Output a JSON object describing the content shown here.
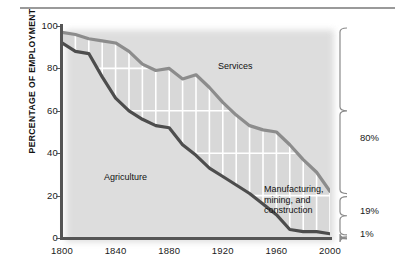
{
  "figure": {
    "top_rule": true
  },
  "axes": {
    "y_axis_title": "PERCENTAGE OF EMPLOYMENT",
    "y_ticks": [
      {
        "value": 100,
        "label": "100"
      },
      {
        "value": 80,
        "label": "80"
      },
      {
        "value": 60,
        "label": "60"
      },
      {
        "value": 40,
        "label": "40"
      },
      {
        "value": 20,
        "label": "20"
      },
      {
        "value": 0,
        "label": "0"
      }
    ],
    "x_ticks": [
      {
        "value": 1800,
        "label": "1800"
      },
      {
        "value": 1840,
        "label": "1840"
      },
      {
        "value": 1880,
        "label": "1880"
      },
      {
        "value": 1920,
        "label": "1920"
      },
      {
        "value": 1960,
        "label": "1960"
      },
      {
        "value": 2000,
        "label": "2000"
      }
    ]
  },
  "labels": {
    "services": "Services",
    "agriculture": "Agriculture",
    "manufacturing_line1": "Manufacturing,",
    "manufacturing_line2": "mining, and",
    "manufacturing_line3": "construction"
  },
  "annotations": {
    "brace_services": "80%",
    "brace_manufacturing": "19%",
    "brace_agriculture": "1%"
  },
  "colors": {
    "agriculture_line": "#4d4d4d",
    "services_line": "#8c8c8c",
    "band_fill": "#d8d8d8",
    "gridline": "#ffffff",
    "axis": "#555555",
    "text": "#1a1a1a"
  },
  "chart_data": {
    "type": "area",
    "title": "",
    "subtitle": "",
    "xlabel": "",
    "ylabel": "PERCENTAGE OF EMPLOYMENT",
    "xlim": [
      1800,
      2000
    ],
    "ylim": [
      0,
      100
    ],
    "grid": true,
    "legend_position": "in-plot annotations",
    "x": [
      1800,
      1810,
      1820,
      1830,
      1840,
      1850,
      1860,
      1870,
      1880,
      1890,
      1900,
      1910,
      1920,
      1930,
      1940,
      1950,
      1960,
      1970,
      1980,
      1990,
      2000
    ],
    "series": [
      {
        "name": "Agriculture",
        "note": "lower dark curve: cumulative share of agriculture",
        "values": [
          92,
          88,
          87,
          76,
          66,
          60,
          56,
          53,
          52,
          44,
          39,
          33,
          29,
          25,
          21,
          16,
          11,
          4,
          3,
          3,
          2
        ]
      },
      {
        "name": "Agriculture + Manufacturing, mining, and construction",
        "note": "upper light curve: top boundary of the manufacturing band",
        "values": [
          97,
          96,
          94,
          93,
          92,
          88,
          82,
          79,
          80,
          75,
          77,
          71,
          64,
          58,
          53,
          51,
          50,
          44,
          37,
          31,
          22
        ]
      }
    ],
    "derived_series": [
      {
        "name": "Manufacturing, mining, and construction",
        "values": [
          5,
          8,
          7,
          17,
          26,
          28,
          26,
          26,
          28,
          31,
          38,
          38,
          35,
          33,
          32,
          35,
          39,
          40,
          34,
          28,
          20
        ]
      },
      {
        "name": "Services",
        "values": [
          3,
          4,
          6,
          7,
          8,
          12,
          18,
          21,
          20,
          25,
          23,
          29,
          36,
          42,
          47,
          49,
          50,
          56,
          63,
          69,
          78
        ]
      }
    ],
    "endpoint_shares_2000": {
      "services": 80,
      "manufacturing_mining_construction": 19,
      "agriculture": 1
    }
  }
}
